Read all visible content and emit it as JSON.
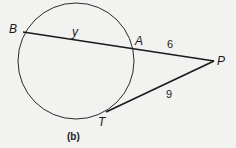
{
  "figure": {
    "caption": "(b)",
    "colors": {
      "background": "#f2f2f0",
      "stroke": "#1a1a1a",
      "circle": "#2a2a2a"
    },
    "points": {
      "B": {
        "label": "B"
      },
      "A": {
        "label": "A"
      },
      "P": {
        "label": "P"
      },
      "T": {
        "label": "T"
      }
    },
    "segments": {
      "BA": {
        "label": "y"
      },
      "AP": {
        "label": "6"
      },
      "PT": {
        "label": "9"
      }
    }
  }
}
